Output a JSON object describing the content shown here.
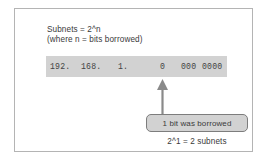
{
  "figure": {
    "formula": {
      "line1": "Subnets = 2^n",
      "line2": "(where n = bits borrowed)"
    },
    "address_bar": {
      "octet_1": "192.",
      "octet_2": "168.",
      "octet_3": "1.",
      "borrowed_bit": "0",
      "host_bits_a": "000",
      "host_bits_b": "0000",
      "background_color": "#d2d2d2",
      "text_color": "#444444"
    },
    "callout": {
      "label": "1 bit was borrowed",
      "fill_color": "#d2d2d2",
      "border_color": "#7d7d7d"
    },
    "arrow": {
      "name": "up-arrow",
      "color": "#8a8a8a"
    },
    "result": "2^1 = 2 subnets",
    "frame_color": "#b4b4b4"
  }
}
